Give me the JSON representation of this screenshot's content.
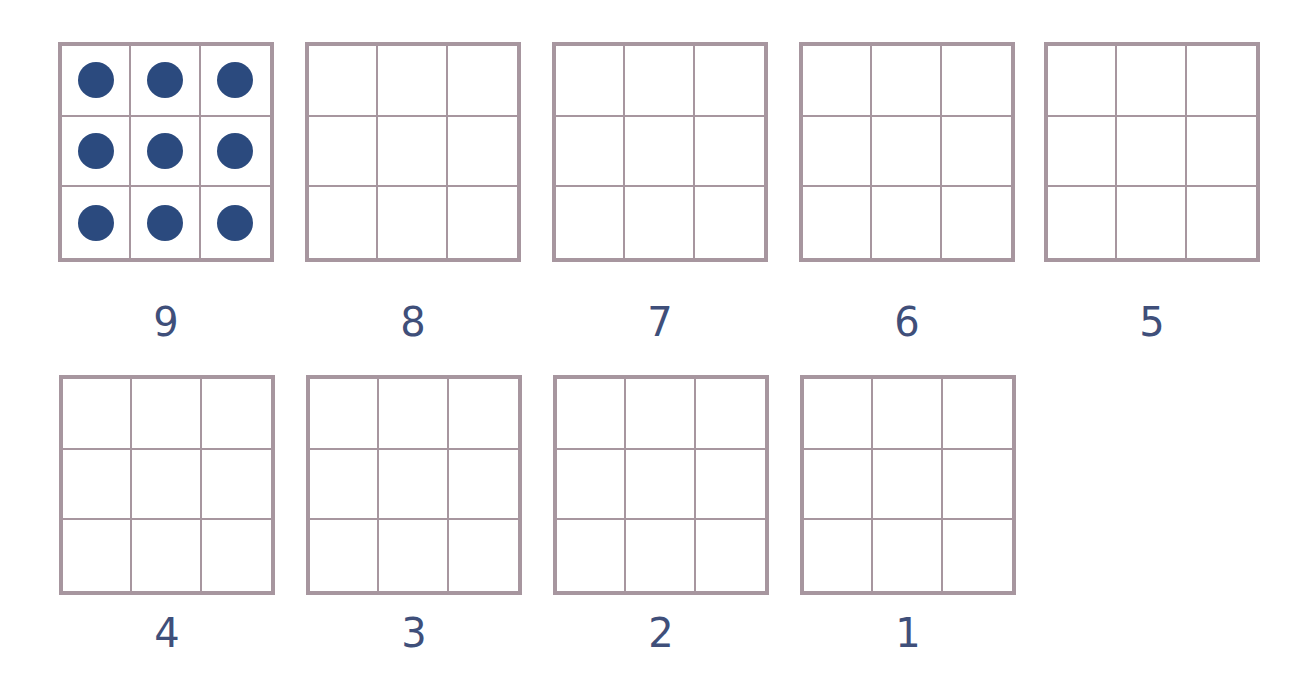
{
  "worksheet": {
    "colors": {
      "grid_line": "#a7969f",
      "dot": "#2b4a7e",
      "label": "#3f4f7a"
    },
    "frames": [
      {
        "label": "9",
        "dots": 9,
        "x": 58,
        "y": 42,
        "label_y": 302
      },
      {
        "label": "8",
        "dots": 0,
        "x": 305,
        "y": 42,
        "label_y": 302
      },
      {
        "label": "7",
        "dots": 0,
        "x": 552,
        "y": 42,
        "label_y": 302
      },
      {
        "label": "6",
        "dots": 0,
        "x": 799,
        "y": 42,
        "label_y": 302
      },
      {
        "label": "5",
        "dots": 0,
        "x": 1044,
        "y": 42,
        "label_y": 302
      },
      {
        "label": "4",
        "dots": 0,
        "x": 59,
        "y": 375,
        "label_y": 613
      },
      {
        "label": "3",
        "dots": 0,
        "x": 306,
        "y": 375,
        "label_y": 613
      },
      {
        "label": "2",
        "dots": 0,
        "x": 553,
        "y": 375,
        "label_y": 613
      },
      {
        "label": "1",
        "dots": 0,
        "x": 800,
        "y": 375,
        "label_y": 613
      }
    ]
  }
}
